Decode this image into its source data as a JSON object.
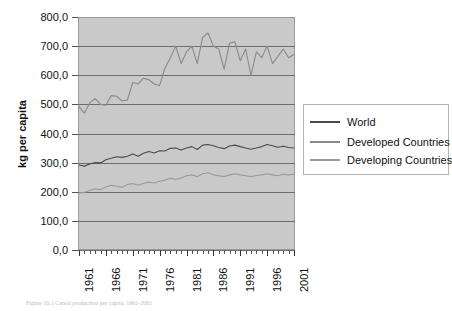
{
  "chart_data": {
    "type": "line",
    "title": "",
    "xlabel": "",
    "ylabel": "kg per capita",
    "xlim": [
      1961,
      2001
    ],
    "ylim": [
      0,
      800
    ],
    "grid": true,
    "legend_position": "right",
    "ytick_labels": [
      "800,0",
      "700,0",
      "600,0",
      "500,0",
      "400,0",
      "300,0",
      "200,0",
      "100,0",
      "0,0"
    ],
    "ytick_values": [
      800,
      700,
      600,
      500,
      400,
      300,
      200,
      100,
      0
    ],
    "xtick_labels": [
      "1961",
      "1966",
      "1971",
      "1976",
      "1981",
      "1986",
      "1991",
      "1996",
      "2001"
    ],
    "xtick_values": [
      1961,
      1966,
      1971,
      1976,
      1981,
      1986,
      1991,
      1996,
      2001
    ],
    "x": [
      1961,
      1962,
      1963,
      1964,
      1965,
      1966,
      1967,
      1968,
      1969,
      1970,
      1971,
      1972,
      1973,
      1974,
      1975,
      1976,
      1977,
      1978,
      1979,
      1980,
      1981,
      1982,
      1983,
      1984,
      1985,
      1986,
      1987,
      1988,
      1989,
      1990,
      1991,
      1992,
      1993,
      1994,
      1995,
      1996,
      1997,
      1998,
      1999,
      2000,
      2001
    ],
    "series": [
      {
        "name": "World",
        "color": "#4a4a4a",
        "values": [
          292,
          288,
          295,
          300,
          299,
          310,
          315,
          320,
          318,
          322,
          330,
          322,
          332,
          338,
          333,
          341,
          340,
          349,
          350,
          343,
          350,
          355,
          345,
          360,
          362,
          358,
          352,
          348,
          357,
          360,
          355,
          350,
          346,
          350,
          355,
          362,
          358,
          353,
          356,
          352,
          350
        ]
      },
      {
        "name": "Developed Countries",
        "color": "#8a8a8a",
        "values": [
          492,
          470,
          505,
          520,
          500,
          497,
          530,
          528,
          512,
          515,
          575,
          570,
          590,
          585,
          570,
          565,
          625,
          660,
          700,
          640,
          680,
          700,
          640,
          730,
          745,
          700,
          690,
          620,
          710,
          715,
          650,
          690,
          600,
          680,
          660,
          700,
          640,
          665,
          690,
          660,
          672
        ]
      },
      {
        "name": "Developing Countries",
        "color": "#9a9a9a",
        "values": [
          196,
          198,
          204,
          210,
          207,
          216,
          222,
          219,
          215,
          225,
          228,
          222,
          229,
          233,
          230,
          236,
          240,
          246,
          243,
          247,
          255,
          258,
          252,
          262,
          265,
          258,
          255,
          252,
          258,
          262,
          258,
          255,
          252,
          256,
          258,
          262,
          258,
          255,
          260,
          258,
          260
        ]
      }
    ]
  },
  "legend": {
    "items": [
      {
        "label": "World"
      },
      {
        "label": "Developed Countries"
      },
      {
        "label": "Developing Countries"
      }
    ]
  },
  "caption": {
    "text": "Figure 10.1 Cereal production per capita, 1961-2001"
  }
}
